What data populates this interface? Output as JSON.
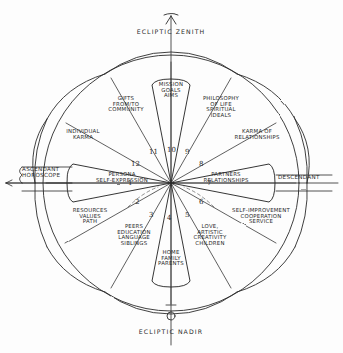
{
  "diagram": {
    "poles": {
      "top": "ECLIPTIC ZENITH",
      "bottom": "ECLIPTIC NADIR"
    },
    "axes": {
      "left": "ASCENDANT\nHOROSCOPE",
      "right": "DESCENDANT"
    },
    "center_label": "",
    "houses": [
      {
        "number": "1",
        "label": "PERSONA\nSELF-EXPRESSION"
      },
      {
        "number": "2",
        "label": "RESOURCES\nVALUES\nPATH"
      },
      {
        "number": "3",
        "label": "PEERS\nEDUCATION\nLANGUAGE\nSIBLINGS"
      },
      {
        "number": "4",
        "label": "HOME\nFAMILY\nPARENTS"
      },
      {
        "number": "5",
        "label": "LOVE,\nARTISTIC\nCREATIVITY\nCHILDREN"
      },
      {
        "number": "6",
        "label": "SELF-IMPROVEMENT\nCOOPERATION\nSERVICE"
      },
      {
        "number": "7",
        "label": "PARTNERS\nRELATIONSHIPS"
      },
      {
        "number": "8",
        "label": "KARMA OF\nRELATIONSHIPS"
      },
      {
        "number": "9",
        "label": "PHILOSOPHY\nOF LIFE\nSPIRITUAL\nIDEALS"
      },
      {
        "number": "10",
        "label": "MISSION\nGOALS\nAIMS"
      },
      {
        "number": "11",
        "label": "GIFTS\nFROM/TO\nCOMMUNITY"
      },
      {
        "number": "12",
        "label": "INDIVIDUAL\nKARMA"
      }
    ],
    "colors": {
      "ink": "#2b2b2b",
      "background": "#fdfdfd"
    },
    "markers": {
      "zenith_arrow": "up-arrow-marker",
      "nadir_circle": "circle-marker"
    }
  }
}
